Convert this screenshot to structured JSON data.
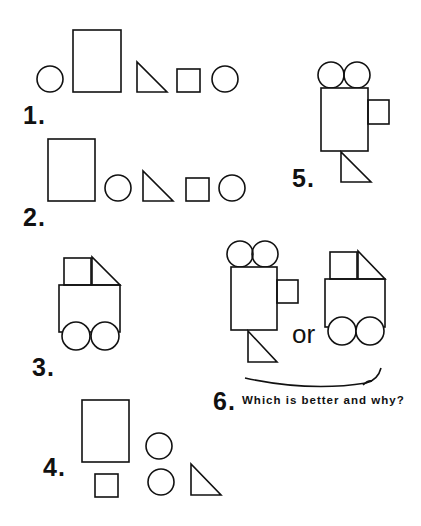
{
  "labels": {
    "fig1": "1.",
    "fig2": "2.",
    "fig3": "3.",
    "fig4": "4.",
    "fig5": "5.",
    "fig6": "6.",
    "or": "or",
    "question": "Which is better and why?"
  },
  "figures": [
    {
      "id": 1,
      "description": "Row: circle, tall rectangle, right triangle, square, circle"
    },
    {
      "id": 2,
      "description": "Row: tall rectangle, circle, right triangle, square, circle"
    },
    {
      "id": 3,
      "description": "Vehicle: square and triangle cab on rectangle body with two circle wheels"
    },
    {
      "id": 4,
      "description": "Scattered: tall rectangle, square, two circles, right triangle"
    },
    {
      "id": 5,
      "description": "Camera/robot: two circles atop tall rectangle, square on side, triangle below"
    },
    {
      "id": 6,
      "description": "Comparison of figure 5 shape vs figure 3 shape with connecting arc"
    }
  ],
  "colors": {
    "stroke": "#111111",
    "background": "#ffffff"
  }
}
